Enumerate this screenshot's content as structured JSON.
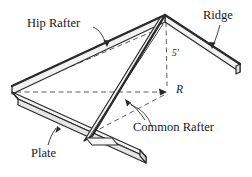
{
  "figure": {
    "labels": {
      "hip_rafter": "Hip Rafter",
      "ridge": "Ridge",
      "plate": "Plate",
      "common_rafter": "Common Rafter",
      "rise": "5'",
      "point_r": "R"
    },
    "colors": {
      "line": "#2b2b2b",
      "fill": "#f2f2f2",
      "dashed": "#4a4a4a",
      "background": "#ffffff",
      "text": "#1a1a1a"
    },
    "geometry": {
      "apex": [
        165,
        15
      ],
      "ridge_end": [
        240,
        70
      ],
      "left_corner": [
        12,
        92
      ],
      "plate_end": [
        142,
        158
      ],
      "rafter_foot": [
        88,
        140
      ],
      "point_r": [
        168,
        92
      ],
      "rise_feet": 5
    }
  }
}
